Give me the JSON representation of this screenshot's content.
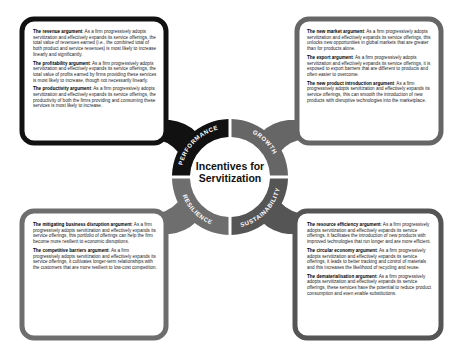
{
  "title": {
    "line1": "Incentives for",
    "line2": "Servitization"
  },
  "colors": {
    "performance": "#111111",
    "growth": "#666666",
    "resilience": "#6e6e6e",
    "sustainability": "#555555",
    "text": "#222222"
  },
  "quadrants": [
    {
      "label": "PERFORMANCE",
      "items": [
        {
          "heading": "The revenue argument",
          "text": ": As a firm progressively adopts servitization and effectively expands its service offerings, the total value of revenues earned (i.e., the combined total of both product and service revenues) is most likely to increase linearly and significantly."
        },
        {
          "heading": "The profitability argument",
          "text": ": As a firm progressively adopts servitization and effectively expands its service offerings, the total value of profits earned by firms providing these services is most likely to increase, though not necessarily linearly."
        },
        {
          "heading": "The productivity argument",
          "text": ": As a firm progressively adopts servitization and effectively expands its service offerings, the productivity of both the firms providing and consuming these services is most likely to increase."
        }
      ]
    },
    {
      "label": "GROWTH",
      "items": [
        {
          "heading": "The new market argument",
          "text": ": As a firm progressively adopts servitization and effectively expands its service offerings, this unlocks new opportunities in global markets that are greater than for products alone."
        },
        {
          "heading": "The export argument",
          "text": ": As a firm progressively adopts servitization and effectively expands its service offerings, it is exposed to export barriers that are different to products and often easier to overcome."
        },
        {
          "heading": "The new product introduction argument",
          "text": ": As a firm progressively adopts servitization and effectively expands its service offerings, this can smooth the introduction of new products with disruptive technologies into the marketplace."
        }
      ]
    },
    {
      "label": "RESILIENCE",
      "items": [
        {
          "heading": "The mitigating business disruption argument",
          "text": ": As a firm progressively adopts servitization and effectively expands its service offerings, this portfolio of offerings can help the firm become more resilient to economic disruptions."
        },
        {
          "heading": "The competitive barriers argument",
          "text": ": As a firm progressively adopts servitization and effectively expands its service offerings, it cultivates longer-term relationships with the customers that are more resilient to low-cost competition."
        }
      ]
    },
    {
      "label": "SUSTAINABILITY",
      "items": [
        {
          "heading": "The resource efficiency argument",
          "text": ": As a firm progressively adopts servitization and effectively expands its service offerings, it facilitates the introduction of new products with improved technologies that run longer and are more efficient."
        },
        {
          "heading": "The circular economy argument",
          "text": ": As a firm progressively adopts servitization and effectively expands its service offerings, it leads to better tracking and control of materials and this increases the likelihood of recycling and reuse."
        },
        {
          "heading": "The dematerialisation argument",
          "text": ": As a firm progressively adopts servitization and effectively expands its service offerings, these services have the potential to reduce product consumption and even enable substitutions."
        }
      ]
    }
  ]
}
